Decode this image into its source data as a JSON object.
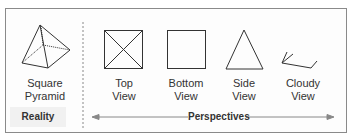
{
  "reality": {
    "shape_label_line1": "Square",
    "shape_label_line2": "Pyramid",
    "section_label": "Reality"
  },
  "perspectives": {
    "section_label": "Perspectives",
    "views": [
      {
        "line1": "Top",
        "line2": "View"
      },
      {
        "line1": "Bottom",
        "line2": "View"
      },
      {
        "line1": "Side",
        "line2": "View"
      },
      {
        "line1": "Cloudy",
        "line2": "View"
      }
    ]
  },
  "colors": {
    "stroke": "#333333",
    "border": "#8a8a8a",
    "arrow": "#888888"
  }
}
